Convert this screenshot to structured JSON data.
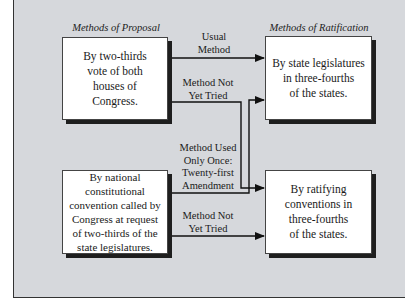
{
  "headings": {
    "proposal": "Methods of Proposal",
    "ratification": "Methods of Ratification"
  },
  "boxes": {
    "proposal_congress": "By two-thirds\nvote of both\nhouses of\nCongress.",
    "proposal_convention": "By national\nconstitutional\nconvention called by\nCongress at request\nof two-thirds of the\nstate legislatures.",
    "ratify_legislatures": "By state legislatures\nin three-fourths\nof the states.",
    "ratify_conventions": "By ratifying\nconventions in\nthree-fourths\nof the states."
  },
  "edges": {
    "usual": "Usual\nMethod",
    "not_tried_1": "Method Not\nYet Tried",
    "used_once": "Method Used\nOnly Once:\nTwenty-first\nAmendment",
    "not_tried_2": "Method Not\nYet Tried"
  }
}
